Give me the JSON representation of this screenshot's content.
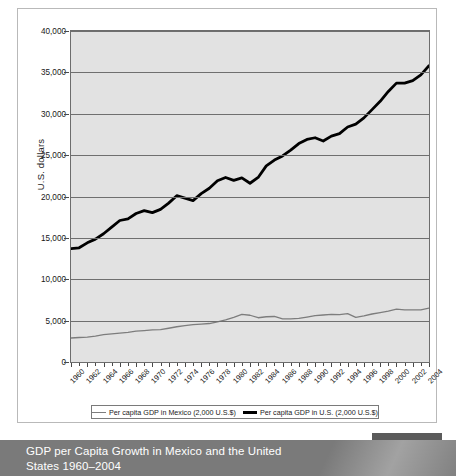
{
  "figure": {
    "caption": "GDP per Capita Growth in Mexico and the United States 1960–2004",
    "badge_label": "FIGURE 11.3",
    "badge_bar_color": "#5b5b5b",
    "caption_band_color": "#7a7a7a"
  },
  "chart_data": {
    "type": "line",
    "title": "",
    "subtitle": "",
    "xlabel": "",
    "ylabel": "U.S. dollars",
    "xlim": [
      1960,
      2004
    ],
    "ylim": [
      0,
      40000
    ],
    "grid": true,
    "legend_position": "bottom",
    "plot_background": "#e2e2e2",
    "y_ticks": [
      0,
      5000,
      10000,
      15000,
      20000,
      25000,
      30000,
      35000,
      40000
    ],
    "y_tick_labels": [
      "0",
      "5,000",
      "10,000",
      "15,000",
      "20,000",
      "25,000",
      "30,000",
      "35,000",
      "40,000"
    ],
    "x_tick_labels": [
      "1960",
      "1962",
      "1964",
      "1966",
      "1968",
      "1970",
      "1972",
      "1974",
      "1976",
      "1978",
      "1980",
      "1982",
      "1984",
      "1986",
      "1988",
      "1990",
      "1992",
      "1994",
      "1996",
      "1998",
      "2000",
      "2002",
      "2004"
    ],
    "x": [
      1960,
      1961,
      1962,
      1963,
      1964,
      1965,
      1966,
      1967,
      1968,
      1969,
      1970,
      1971,
      1972,
      1973,
      1974,
      1975,
      1976,
      1977,
      1978,
      1979,
      1980,
      1981,
      1982,
      1983,
      1984,
      1985,
      1986,
      1987,
      1988,
      1989,
      1990,
      1991,
      1992,
      1993,
      1994,
      1995,
      1996,
      1997,
      1998,
      1999,
      2000,
      2001,
      2002,
      2003,
      2004
    ],
    "series": [
      {
        "name": "Per capita GDP in Mexico (2,000 U.S.$)",
        "color": "#7d7d7d",
        "line_width": 1.3,
        "values": [
          2900,
          2960,
          3010,
          3130,
          3300,
          3400,
          3500,
          3590,
          3720,
          3800,
          3880,
          3920,
          4080,
          4260,
          4400,
          4520,
          4580,
          4650,
          4850,
          5100,
          5400,
          5750,
          5650,
          5350,
          5470,
          5500,
          5200,
          5220,
          5260,
          5430,
          5600,
          5680,
          5750,
          5720,
          5850,
          5400,
          5580,
          5800,
          5980,
          6150,
          6400,
          6300,
          6300,
          6300,
          6500
        ]
      },
      {
        "name": "Per capita GDP in U.S. (2,000 U.S.$)",
        "color": "#000000",
        "line_width": 2.8,
        "values": [
          13700,
          13800,
          14400,
          14850,
          15500,
          16300,
          17100,
          17300,
          17950,
          18300,
          18050,
          18450,
          19200,
          20100,
          19800,
          19500,
          20350,
          21000,
          21900,
          22300,
          21950,
          22250,
          21600,
          22300,
          23700,
          24400,
          24900,
          25600,
          26400,
          26900,
          27100,
          26700,
          27300,
          27600,
          28400,
          28750,
          29500,
          30500,
          31500,
          32700,
          33700,
          33700,
          34000,
          34700,
          35800
        ]
      }
    ],
    "annotations": []
  },
  "legend": {
    "entries": [
      {
        "label": "Per capita GDP in Mexico (2,000 U.S.$)",
        "swatch": "thin-gray-line"
      },
      {
        "label": "Per capita GDP in U.S. (2,000 U.S.$)",
        "swatch": "thick-black-line"
      }
    ]
  }
}
